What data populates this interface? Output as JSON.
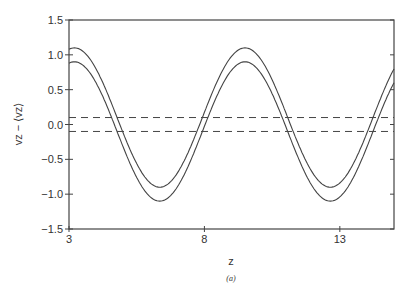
{
  "chart_data": {
    "type": "line",
    "title": "",
    "xlabel": "z",
    "ylabel": "vz − ⟨vz⟩",
    "caption": "(a)",
    "xlim": [
      3,
      15
    ],
    "ylim": [
      -1.5,
      1.5
    ],
    "xticks": [
      3,
      8,
      13
    ],
    "xtick_labels": [
      "3",
      "8",
      "13"
    ],
    "yticks": [
      -1.5,
      -1.0,
      -0.5,
      0.0,
      0.5,
      1.0,
      1.5
    ],
    "ytick_labels": [
      "−1.5",
      "−1.0",
      "−0.5",
      "0.0",
      "0.5",
      "1.0",
      "1.5"
    ],
    "grid": false,
    "legend": null,
    "series": [
      {
        "name": "upper envelope",
        "style": "solid",
        "formula": "0.1 + cos(2π(z−3.2)/6.3)",
        "x": [
          3,
          4,
          5,
          6,
          6.35,
          7,
          8,
          9,
          9.5,
          10,
          11,
          12,
          12.65,
          13,
          14,
          15
        ],
        "values": [
          1.09,
          0.68,
          -0.33,
          -0.83,
          -0.9,
          -0.69,
          0.25,
          0.99,
          1.1,
          0.89,
          -0.12,
          -0.78,
          -0.9,
          -0.81,
          -0.11,
          0.83
        ]
      },
      {
        "name": "lower envelope",
        "style": "solid",
        "formula": "−0.1 + cos(2π(z−3.2)/6.3)",
        "x": [
          3,
          4,
          5,
          6,
          6.35,
          7,
          8,
          9,
          9.5,
          10,
          11,
          12,
          12.65,
          13,
          14,
          15
        ],
        "values": [
          0.89,
          0.48,
          -0.53,
          -1.03,
          -1.1,
          -0.89,
          0.05,
          0.79,
          0.9,
          0.69,
          -0.32,
          -0.98,
          -1.1,
          -1.01,
          -0.31,
          0.63
        ]
      },
      {
        "name": "upper threshold",
        "style": "dashed",
        "x": [
          3,
          15
        ],
        "values": [
          0.1,
          0.1
        ]
      },
      {
        "name": "lower threshold",
        "style": "dashed",
        "x": [
          3,
          15
        ],
        "values": [
          -0.1,
          -0.1
        ]
      }
    ]
  }
}
